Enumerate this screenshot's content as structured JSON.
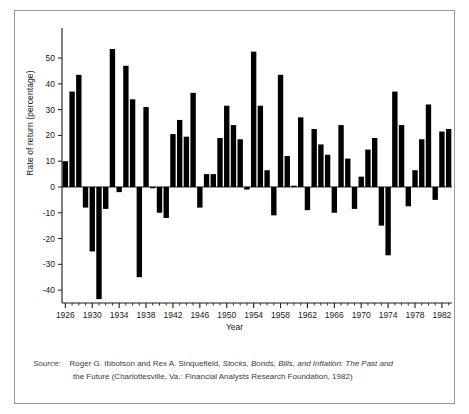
{
  "figure": {
    "xlabel": "Year",
    "ylabel": "Rate of return (percentage)"
  },
  "caption": {
    "tag": "Source:",
    "line1_a": "Roger G. Ibbotson and Rex A. Sinquefield, ",
    "line1_italic": "Stocks, Bonds, Bills, and Inflation: The Past and",
    "line2_italic": "the Future",
    "line2_b": " (Charlottesville, Va.: Financial Analysts Research Foundation, 1982)"
  },
  "chart_data": {
    "type": "bar",
    "title": "",
    "xlabel": "Year",
    "ylabel": "Rate of return (percentage)",
    "xlim": [
      1925.5,
      1983.5
    ],
    "ylim": [
      -45,
      57
    ],
    "yticks": [
      -40,
      -30,
      -20,
      -10,
      0,
      10,
      20,
      30,
      40,
      50
    ],
    "ytick_labels": [
      "-40",
      "-30",
      "-20",
      "-10",
      "0",
      "10",
      "20",
      "30",
      "40",
      "50"
    ],
    "xticks_labeled": [
      1926,
      1930,
      1934,
      1938,
      1942,
      1946,
      1950,
      1954,
      1958,
      1962,
      1966,
      1970,
      1974,
      1978,
      1982
    ],
    "xtick_minor_step": 1,
    "grid": false,
    "legend": null,
    "bar_color": "#000000",
    "categories": [
      1926,
      1927,
      1928,
      1929,
      1930,
      1931,
      1932,
      1933,
      1934,
      1935,
      1936,
      1937,
      1938,
      1939,
      1940,
      1941,
      1942,
      1943,
      1944,
      1945,
      1946,
      1947,
      1948,
      1949,
      1950,
      1951,
      1952,
      1953,
      1954,
      1955,
      1956,
      1957,
      1958,
      1959,
      1960,
      1961,
      1962,
      1963,
      1964,
      1965,
      1966,
      1967,
      1968,
      1969,
      1970,
      1971,
      1972,
      1973,
      1974,
      1975,
      1976,
      1977,
      1978,
      1979,
      1980,
      1981,
      1982,
      1983
    ],
    "values": [
      10.0,
      37.0,
      43.5,
      -8.0,
      -25.0,
      -43.5,
      -8.5,
      53.5,
      -2.0,
      47.0,
      34.0,
      -35.0,
      31.0,
      -0.5,
      -10.0,
      -12.0,
      20.5,
      26.0,
      19.5,
      36.5,
      -8.0,
      5.0,
      5.0,
      19.0,
      31.5,
      24.0,
      18.5,
      -1.0,
      52.5,
      31.5,
      6.5,
      -11.0,
      43.5,
      12.0,
      0.5,
      27.0,
      -9.0,
      22.5,
      16.5,
      12.5,
      -10.0,
      24.0,
      11.0,
      -8.5,
      4.0,
      14.5,
      19.0,
      -15.0,
      -26.5,
      37.0,
      24.0,
      -7.5,
      6.5,
      18.5,
      32.0,
      -5.0,
      21.5,
      22.5
    ]
  }
}
